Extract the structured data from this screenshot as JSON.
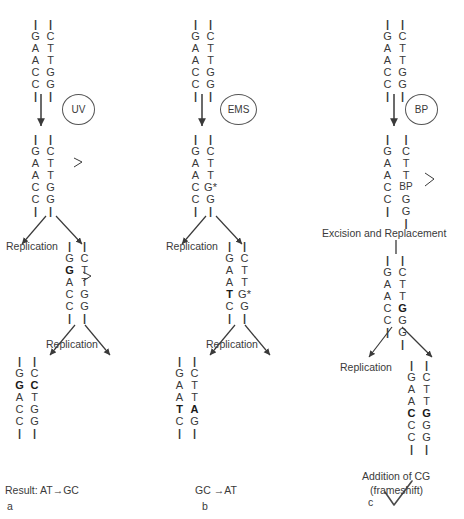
{
  "figure": {
    "caption_letters": {
      "a": "a",
      "b": "b",
      "c": "c"
    }
  },
  "panels": [
    {
      "id": "a",
      "agent": {
        "name": "UV",
        "label": "UV"
      },
      "letter": "a",
      "result_label": "Result: AT→GC",
      "steps": [
        {
          "name": "original-duplex",
          "left": [
            "|",
            "G",
            "A",
            "A",
            "C",
            "C",
            "|"
          ],
          "right": [
            "|",
            "C",
            "T",
            "T",
            "G",
            "G",
            "|"
          ],
          "left_bold": [
            false,
            false,
            false,
            false,
            false,
            false,
            false
          ],
          "right_bold": [
            false,
            false,
            false,
            false,
            false,
            false,
            false
          ]
        },
        {
          "name": "damaged-duplex",
          "left": [
            "|",
            "G",
            "A",
            "A",
            "C",
            "C",
            "|"
          ],
          "right": [
            "|",
            "C",
            "T",
            "T",
            "G",
            "G",
            "|"
          ],
          "left_bold": [
            false,
            false,
            false,
            false,
            false,
            false,
            false
          ],
          "right_bold": [
            false,
            false,
            false,
            false,
            false,
            false,
            false
          ],
          "lesion_bracket": true
        },
        {
          "name": "after-first-replication",
          "left": [
            "|",
            "G",
            "G",
            "A",
            "C",
            "C",
            "|"
          ],
          "right": [
            "|",
            "C",
            "T",
            "T",
            "G",
            "G",
            "|"
          ],
          "left_bold": [
            false,
            false,
            true,
            false,
            false,
            false,
            false
          ],
          "right_bold": [
            false,
            false,
            false,
            false,
            false,
            false,
            false
          ],
          "lesion_bracket": true
        },
        {
          "name": "after-second-replication",
          "left": [
            "|",
            "G",
            "G",
            "A",
            "C",
            "C",
            "|"
          ],
          "right": [
            "|",
            "C",
            "C",
            "T",
            "G",
            "G",
            "|"
          ],
          "left_bold": [
            false,
            false,
            true,
            false,
            false,
            false,
            false
          ],
          "right_bold": [
            false,
            false,
            true,
            false,
            false,
            false,
            false
          ]
        }
      ],
      "replication_labels": [
        "Replication",
        "Replication"
      ]
    },
    {
      "id": "b",
      "agent": {
        "name": "EMS",
        "label": "EMS"
      },
      "letter": "b",
      "result_label": "GC →AT",
      "steps": [
        {
          "name": "original-duplex",
          "left": [
            "|",
            "G",
            "A",
            "A",
            "C",
            "C",
            "|"
          ],
          "right": [
            "|",
            "C",
            "T",
            "T",
            "G",
            "G",
            "|"
          ],
          "left_bold": [
            false,
            false,
            false,
            false,
            false,
            false,
            false
          ],
          "right_bold": [
            false,
            false,
            false,
            false,
            false,
            false,
            false
          ]
        },
        {
          "name": "alkylated-duplex",
          "left": [
            "|",
            "G",
            "A",
            "A",
            "C",
            "C",
            "|"
          ],
          "right": [
            "|",
            "C",
            "T",
            "T",
            "G*",
            "G",
            "|"
          ],
          "left_bold": [
            false,
            false,
            false,
            false,
            false,
            false,
            false
          ],
          "right_bold": [
            false,
            false,
            false,
            false,
            false,
            false,
            false
          ]
        },
        {
          "name": "after-first-replication",
          "left": [
            "|",
            "G",
            "A",
            "A",
            "T",
            "C",
            "|"
          ],
          "right": [
            "|",
            "C",
            "T",
            "T",
            "G*",
            "G",
            "|"
          ],
          "left_bold": [
            false,
            false,
            false,
            false,
            true,
            false,
            false
          ],
          "right_bold": [
            false,
            false,
            false,
            false,
            false,
            false,
            false
          ]
        },
        {
          "name": "after-second-replication",
          "left": [
            "|",
            "G",
            "A",
            "A",
            "T",
            "C",
            "|"
          ],
          "right": [
            "|",
            "C",
            "T",
            "T",
            "A",
            "G",
            "|"
          ],
          "left_bold": [
            false,
            false,
            false,
            false,
            true,
            false,
            false
          ],
          "right_bold": [
            false,
            false,
            false,
            false,
            true,
            false,
            false
          ]
        }
      ],
      "replication_labels": [
        "Replication",
        "Replication"
      ]
    },
    {
      "id": "c",
      "agent": {
        "name": "BP",
        "label": "BP"
      },
      "letter": "c",
      "result_label_line1": "Addition of CG",
      "result_label_line2": "(frameshift)",
      "excision_label": "Excision and Replacement",
      "steps": [
        {
          "name": "original-duplex",
          "left": [
            "|",
            "G",
            "A",
            "A",
            "C",
            "C",
            "|"
          ],
          "right": [
            "|",
            "C",
            "T",
            "T",
            "G",
            "G",
            "|"
          ],
          "left_bold": [
            false,
            false,
            false,
            false,
            false,
            false,
            false
          ],
          "right_bold": [
            false,
            false,
            false,
            false,
            false,
            false,
            false
          ]
        },
        {
          "name": "intercalated-duplex",
          "left": [
            "|",
            "G",
            "A",
            "A",
            "C",
            "C",
            "|",
            ""
          ],
          "right": [
            "|",
            "C",
            "T",
            "T",
            "BP",
            "G",
            "G",
            "|"
          ],
          "left_bold": [
            false,
            false,
            false,
            false,
            false,
            false,
            false,
            false
          ],
          "right_bold": [
            false,
            false,
            false,
            false,
            false,
            false,
            false,
            false
          ],
          "lesion_bracket": true
        },
        {
          "name": "after-excision-replacement",
          "left": [
            "|",
            "G",
            "A",
            "A",
            "C",
            "C",
            "|",
            ""
          ],
          "right": [
            "|",
            "C",
            "T",
            "T",
            "G",
            "G",
            "G",
            "|"
          ],
          "left_bold": [
            false,
            false,
            false,
            false,
            false,
            false,
            false,
            false
          ],
          "right_bold": [
            false,
            false,
            false,
            false,
            true,
            false,
            false,
            false
          ]
        },
        {
          "name": "after-replication",
          "left": [
            "|",
            "G",
            "A",
            "A",
            "C",
            "C",
            "C",
            "|"
          ],
          "right": [
            "|",
            "C",
            "T",
            "T",
            "G",
            "G",
            "G",
            "|"
          ],
          "left_bold": [
            false,
            false,
            false,
            false,
            true,
            false,
            false,
            false
          ],
          "right_bold": [
            false,
            false,
            false,
            false,
            true,
            false,
            false,
            false
          ]
        }
      ],
      "replication_labels": [
        "Replication"
      ]
    }
  ],
  "colors": {
    "ink": "#3a3a3a",
    "bold_ink": "#1a1a1a",
    "background": "#ffffff",
    "check_mark": "#4a4a4a"
  }
}
